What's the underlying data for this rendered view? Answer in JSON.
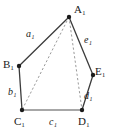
{
  "figure": {
    "type": "geometry-diagram",
    "shape_name": "pentagon",
    "background_color": "#ffffff",
    "stroke_color": "#3c3c3c",
    "highlight_edge_color": "#8a8a8a",
    "dashed_color": "#9a9a9a",
    "vertex_dot_color": "#1a1a1a"
  },
  "vertices": [
    {
      "id": "A1",
      "base": "A",
      "subscript": "1",
      "label": "A₁",
      "x": 69,
      "y": 17,
      "label_x": 74,
      "label_y": 4
    },
    {
      "id": "B1",
      "base": "B",
      "subscript": "1",
      "label": "B₁",
      "x": 19,
      "y": 66,
      "label_x": 4,
      "label_y": 60
    },
    {
      "id": "C1",
      "base": "C",
      "subscript": "1",
      "label": "C₁",
      "x": 22,
      "y": 110,
      "label_x": 14,
      "label_y": 117
    },
    {
      "id": "D1",
      "base": "D",
      "subscript": "1",
      "label": "D₁",
      "x": 82,
      "y": 110,
      "label_x": 79,
      "label_y": 117
    },
    {
      "id": "E1",
      "base": "E",
      "subscript": "1",
      "label": "E₁",
      "x": 93,
      "y": 75,
      "label_x": 96,
      "label_y": 66
    }
  ],
  "edges": [
    {
      "id": "a1",
      "label": "a₁",
      "base": "a",
      "subscript": "1",
      "from": "A1",
      "to": "B1",
      "style": "solid",
      "color": "#3c3c3c",
      "label_x": 26,
      "label_y": 30
    },
    {
      "id": "b1",
      "label": "b₁",
      "base": "b",
      "subscript": "1",
      "from": "B1",
      "to": "C1",
      "style": "solid",
      "color": "#3c3c3c",
      "label_x": 8,
      "label_y": 88
    },
    {
      "id": "c1",
      "label": "c₁",
      "base": "c",
      "subscript": "1",
      "from": "C1",
      "to": "D1",
      "style": "solid",
      "color": "#8a8a8a",
      "label_x": 49,
      "label_y": 117
    },
    {
      "id": "d1",
      "label": "d₁",
      "base": "d",
      "subscript": "1",
      "from": "D1",
      "to": "E1",
      "style": "solid",
      "color": "#3c3c3c",
      "label_x": 84,
      "label_y": 92
    },
    {
      "id": "e1",
      "label": "e₁",
      "base": "e",
      "subscript": "1",
      "from": "E1",
      "to": "A1",
      "style": "solid",
      "color": "#3c3c3c",
      "label_x": 84,
      "label_y": 36
    }
  ],
  "diagonals": [
    {
      "id": "A1C1",
      "from": "A1",
      "to": "C1",
      "style": "dashed",
      "color": "#9a9a9a"
    },
    {
      "id": "A1D1",
      "from": "A1",
      "to": "D1",
      "style": "dashed",
      "color": "#9a9a9a"
    }
  ]
}
